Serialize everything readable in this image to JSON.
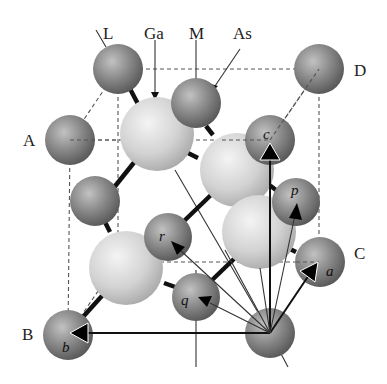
{
  "labels": {
    "L": "L",
    "Ga": "Ga",
    "M": "M",
    "As": "As",
    "D": "D",
    "A": "A",
    "B": "B",
    "C": "C"
  },
  "vectors": {
    "a": "a",
    "b": "b",
    "c": "c",
    "p": "p",
    "q": "q",
    "r": "r"
  },
  "colors": {
    "as_atom": "#7a7a7a",
    "ga_atom": "#d8d8d8",
    "bond": "#111111",
    "cell_edge": "#555555"
  }
}
